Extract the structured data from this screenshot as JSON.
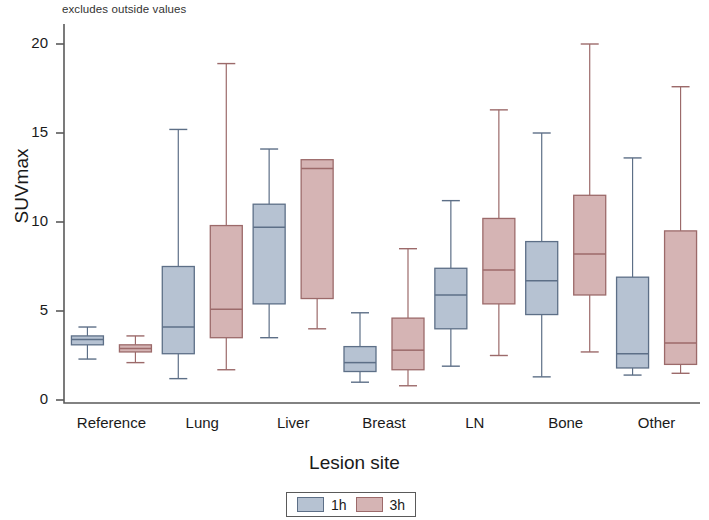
{
  "chart_data": {
    "type": "box",
    "title": "excludes outside values",
    "xlabel": "Lesion site",
    "ylabel": "SUVmax",
    "ylim": [
      0,
      21
    ],
    "yticks": [
      0,
      5,
      10,
      15,
      20
    ],
    "grid": false,
    "legend_position": "bottom",
    "categories": [
      "Reference",
      "Lung",
      "Liver",
      "Breast",
      "LN",
      "Bone",
      "Other"
    ],
    "series": [
      {
        "name": "1h",
        "color": "#b6c2d2",
        "edge_color": "#5d6f87",
        "boxes": [
          {
            "category": "Reference",
            "whisker_low": 2.3,
            "q1": 3.1,
            "median": 3.4,
            "q3": 3.6,
            "whisker_high": 4.1
          },
          {
            "category": "Lung",
            "whisker_low": 1.2,
            "q1": 2.6,
            "median": 4.1,
            "q3": 7.5,
            "whisker_high": 15.2
          },
          {
            "category": "Liver",
            "whisker_low": 3.5,
            "q1": 5.4,
            "median": 9.7,
            "q3": 11.0,
            "whisker_high": 14.1
          },
          {
            "category": "Breast",
            "whisker_low": 1.0,
            "q1": 1.6,
            "median": 2.1,
            "q3": 3.0,
            "whisker_high": 4.9
          },
          {
            "category": "LN",
            "whisker_low": 1.9,
            "q1": 4.0,
            "median": 5.9,
            "q3": 7.4,
            "whisker_high": 11.2
          },
          {
            "category": "Bone",
            "whisker_low": 1.3,
            "q1": 4.8,
            "median": 6.7,
            "q3": 8.9,
            "whisker_high": 15.0
          },
          {
            "category": "Other",
            "whisker_low": 1.4,
            "q1": 1.8,
            "median": 2.6,
            "q3": 6.9,
            "whisker_high": 13.6
          }
        ]
      },
      {
        "name": "3h",
        "color": "#d5b4b4",
        "edge_color": "#9c6a6a",
        "boxes": [
          {
            "category": "Reference",
            "whisker_low": 2.1,
            "q1": 2.7,
            "median": 2.9,
            "q3": 3.1,
            "whisker_high": 3.6
          },
          {
            "category": "Lung",
            "whisker_low": 1.7,
            "q1": 3.5,
            "median": 5.1,
            "q3": 9.8,
            "whisker_high": 18.9
          },
          {
            "category": "Liver",
            "whisker_low": 4.0,
            "q1": 5.7,
            "median": 13.0,
            "q3": 13.5,
            "whisker_high": 13.5
          },
          {
            "category": "Breast",
            "whisker_low": 0.8,
            "q1": 1.7,
            "median": 2.8,
            "q3": 4.6,
            "whisker_high": 8.5
          },
          {
            "category": "LN",
            "whisker_low": 2.5,
            "q1": 5.4,
            "median": 7.3,
            "q3": 10.2,
            "whisker_high": 16.3
          },
          {
            "category": "Bone",
            "whisker_low": 2.7,
            "q1": 5.9,
            "median": 8.2,
            "q3": 11.5,
            "whisker_high": 20.0
          },
          {
            "category": "Other",
            "whisker_low": 1.5,
            "q1": 2.0,
            "median": 3.2,
            "q3": 9.5,
            "whisker_high": 17.6
          }
        ]
      }
    ]
  },
  "legend": {
    "entries": [
      {
        "label": "1h",
        "color": "#b6c2d2"
      },
      {
        "label": "3h",
        "color": "#d5b4b4"
      }
    ]
  }
}
